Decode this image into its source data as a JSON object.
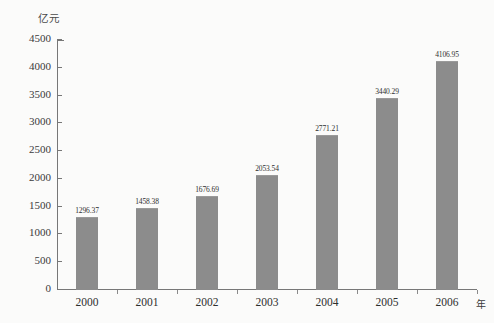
{
  "chart_data": {
    "type": "bar",
    "title": "",
    "subtitle": "",
    "xlabel": "年",
    "ylabel": "亿元",
    "categories": [
      "2000",
      "2001",
      "2002",
      "2003",
      "2004",
      "2005",
      "2006"
    ],
    "values": [
      1296.37,
      1458.38,
      1676.69,
      2053.54,
      2771.21,
      3440.29,
      4106.95
    ],
    "value_labels": [
      "1296.37",
      "1458.38",
      "1676.69",
      "2053.54",
      "2771.21",
      "3440.29",
      "4106.95"
    ],
    "ylim": [
      0,
      4500
    ],
    "ytick_values": [
      0,
      500,
      1000,
      1500,
      2000,
      2500,
      3000,
      3500,
      4000,
      4500
    ],
    "ytick_labels": [
      "0",
      "500",
      "1000",
      "1500",
      "2000",
      "2500",
      "3000",
      "3500",
      "4000",
      "4500"
    ],
    "grid": false,
    "legend": null,
    "legend_position": "none",
    "bar_color": "#8c8c8c",
    "axis_color": "#777777",
    "text_color": "#2e2e2e",
    "background": "#fbfbfa",
    "annotations": []
  }
}
